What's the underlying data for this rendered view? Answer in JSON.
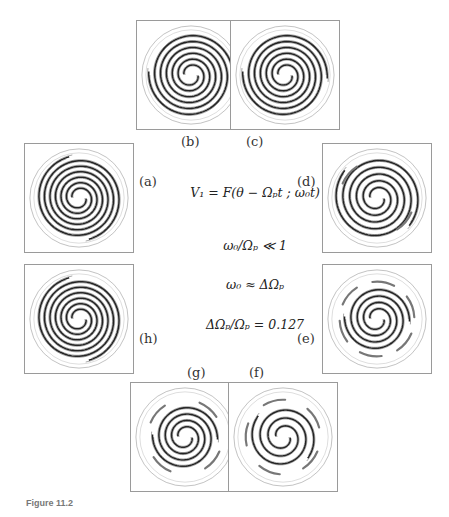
{
  "figure": {
    "panels": [
      {
        "id": "a",
        "label": "(a)",
        "turns": 3.2,
        "blobs": 0
      },
      {
        "id": "b",
        "label": "(b)",
        "turns": 3.0,
        "blobs": 0
      },
      {
        "id": "c",
        "label": "(c)",
        "turns": 3.0,
        "blobs": 0
      },
      {
        "id": "d",
        "label": "(d)",
        "turns": 2.6,
        "blobs": 2
      },
      {
        "id": "e",
        "label": "(e)",
        "turns": 2.0,
        "blobs": 6
      },
      {
        "id": "f",
        "label": "(f)",
        "turns": 1.6,
        "blobs": 5
      },
      {
        "id": "g",
        "label": "(g)",
        "turns": 2.0,
        "blobs": 4
      },
      {
        "id": "h",
        "label": "(h)",
        "turns": 3.2,
        "blobs": 0
      }
    ],
    "equations": [
      "V₁ = F(θ − Ωₚt ; ω₀t)",
      "ω₀/Ωₚ ≪ 1",
      "ω₀ ≈ ΔΩₚ",
      "ΔΩₚ/Ωₚ = 0.127"
    ],
    "caption": "Figure 11.2"
  }
}
